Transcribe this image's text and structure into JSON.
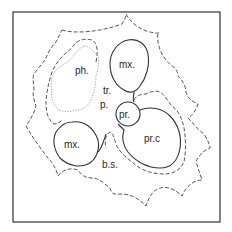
{
  "figure": {
    "type": "anatomical cross-section diagram",
    "labels": {
      "phloem": "ph.",
      "metaxylem_top": "mx.",
      "metaxylem_bottom": "mx.",
      "tracheid": "tr.",
      "parenchyma": "p.",
      "protoxylem": "pr.",
      "protoxylem_cavity": "pr.c",
      "bundle_sheath": "b.s."
    },
    "colors": {
      "frame": "#333333",
      "outline": "#444444",
      "phloem_outline": "#aaaaaa",
      "label": "#2a2a2a",
      "background": "#ffffff"
    }
  }
}
